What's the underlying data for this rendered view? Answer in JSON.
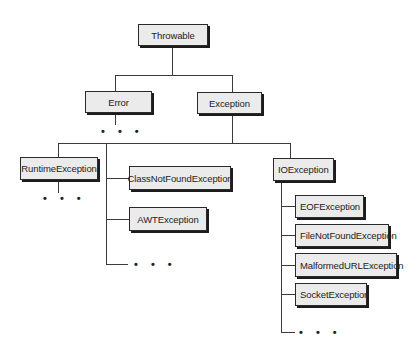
{
  "diagram": {
    "type": "class-hierarchy",
    "nodes": {
      "throwable": "Throwable",
      "error": "Error",
      "exception": "Exception",
      "runtime_exception": "RuntimeException",
      "class_not_found_exception": "ClassNotFoundException",
      "awt_exception": "AWTException",
      "io_exception": "IOException",
      "eof_exception": "EOFException",
      "file_not_found_exception": "FileNotFoundException",
      "malformed_url_exception": "MalformedURLException",
      "socket_exception": "SocketException"
    },
    "ellipsis": "• • •",
    "edges": [
      [
        "Throwable",
        "Error"
      ],
      [
        "Throwable",
        "Exception"
      ],
      [
        "Exception",
        "RuntimeException"
      ],
      [
        "Exception",
        "ClassNotFoundException"
      ],
      [
        "Exception",
        "AWTException"
      ],
      [
        "Exception",
        "IOException"
      ],
      [
        "IOException",
        "EOFException"
      ],
      [
        "IOException",
        "FileNotFoundException"
      ],
      [
        "IOException",
        "MalformedURLException"
      ],
      [
        "IOException",
        "SocketException"
      ]
    ]
  }
}
